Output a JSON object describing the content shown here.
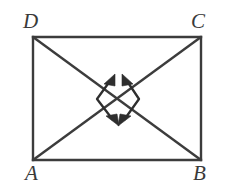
{
  "figure": {
    "shape_name": "rectangle",
    "stroke_color": "#3c3c3c",
    "background_color": "#ffffff",
    "stroke_width": 2,
    "vertices": [
      {
        "id": "D",
        "label": "D",
        "position": "top-left",
        "x": 33,
        "y": 37
      },
      {
        "id": "C",
        "label": "C",
        "position": "top-right",
        "x": 201,
        "y": 37
      },
      {
        "id": "B",
        "label": "B",
        "position": "bottom-right",
        "x": 201,
        "y": 160
      },
      {
        "id": "A",
        "label": "A",
        "position": "bottom-left",
        "x": 33,
        "y": 160
      }
    ],
    "sides": [
      {
        "id": "DC",
        "from": "D",
        "to": "C",
        "name": "top-side"
      },
      {
        "id": "CB",
        "from": "C",
        "to": "B",
        "name": "right-side"
      },
      {
        "id": "AB",
        "from": "A",
        "to": "B",
        "name": "bottom-side"
      },
      {
        "id": "DA",
        "from": "D",
        "to": "A",
        "name": "left-side"
      }
    ],
    "diagonals": [
      {
        "id": "AC",
        "from": "A",
        "to": "C",
        "name": "diagonal-a-c"
      },
      {
        "id": "DB",
        "from": "D",
        "to": "B",
        "name": "diagonal-d-b"
      }
    ],
    "intersection": {
      "x": 117,
      "y": 98.5
    },
    "arrows": [
      {
        "id": "left-double-arrow",
        "name": "left-double-arrow",
        "description": "double-headed bent arrow opening rightward, heads at upper-right and lower-right",
        "head_up": {
          "x": 112,
          "y": 78
        },
        "bend": {
          "x": 97,
          "y": 99
        },
        "head_down": {
          "x": 115,
          "y": 122
        }
      },
      {
        "id": "right-double-arrow",
        "name": "right-double-arrow",
        "description": "double-headed bent arrow opening leftward, heads at upper-left and lower-left",
        "head_up": {
          "x": 125,
          "y": 78
        },
        "bend": {
          "x": 139,
          "y": 99
        },
        "head_down": {
          "x": 122,
          "y": 122
        }
      }
    ]
  },
  "labels": {
    "D": "D",
    "C": "C",
    "A": "A",
    "B": "B"
  }
}
